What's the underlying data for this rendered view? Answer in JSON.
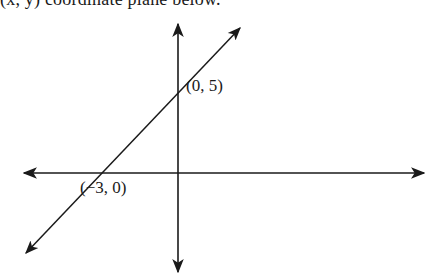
{
  "header": {
    "clipped_text": "(x, y) coordinate plane below."
  },
  "diagram": {
    "type": "coordinate-plane-line",
    "axes": {
      "x_axis": "horizontal",
      "y_axis": "vertical",
      "arrows": "both-ends"
    },
    "line": {
      "points": [
        [
          -3,
          0
        ],
        [
          0,
          5
        ]
      ],
      "slope": "5/3",
      "y_intercept": 5,
      "x_intercept": -3
    },
    "labels": {
      "y_intercept": "(0, 5)",
      "x_intercept": "(−3, 0)"
    }
  },
  "colors": {
    "stroke": "#1a1a1a",
    "background": "#ffffff"
  }
}
